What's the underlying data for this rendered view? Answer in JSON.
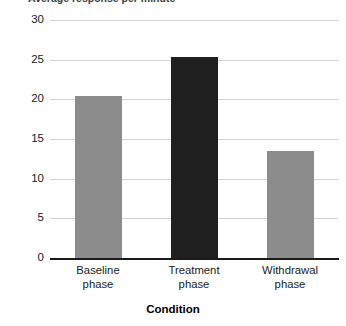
{
  "chart_data": {
    "type": "bar",
    "title": "",
    "clipped_top_title": "Average response per minute",
    "categories": [
      "Baseline phase",
      "Treatment phase",
      "Withdrawal phase"
    ],
    "category_lines": [
      [
        "Baseline",
        "phase"
      ],
      [
        "Treatment",
        "phase"
      ],
      [
        "Withdrawal",
        "phase"
      ]
    ],
    "values": [
      20.4,
      25.3,
      13.5
    ],
    "bar_colors": [
      "#8c8c8c",
      "#1f1f1f",
      "#8c8c8c"
    ],
    "xlabel": "Condition",
    "ylabel": "",
    "ylim": [
      0,
      30
    ],
    "yticks": [
      30,
      25,
      20,
      15,
      10,
      5,
      0
    ],
    "ytick_labels": [
      "30",
      "25",
      "20",
      "15",
      "10",
      "5",
      "0"
    ],
    "grid": true,
    "grid_color": "#d3d3d3",
    "axis_color": "#1b1b1b",
    "legend": null,
    "legend_position": "none"
  },
  "axis": {
    "x_title": "Condition"
  }
}
